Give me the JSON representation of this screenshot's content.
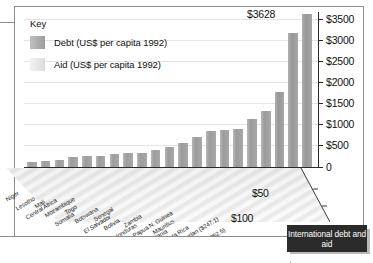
{
  "key": {
    "title": "Key",
    "items": [
      {
        "label": "Debt (US$ per capita 1992)",
        "color": "#9d9d9d",
        "name": "debt"
      },
      {
        "label": "Aid (US$ per capita 1992)",
        "color": "#e4e4e4",
        "name": "aid"
      }
    ]
  },
  "figure_title": "International debt and aid",
  "peak_annotation": "$3628",
  "chart_data": {
    "type": "bar",
    "title": "International debt and aid",
    "subtitle": "",
    "xlabel": "",
    "ylabel": "Debt (US$ per capita 1992)",
    "zlabel": "Aid (US$ per capita 1992)",
    "ylim": [
      0,
      3628
    ],
    "yticks": [
      0,
      500,
      1000,
      1500,
      2000,
      2500,
      3000,
      3500
    ],
    "ytick_labels": [
      "0",
      "$500",
      "$1000",
      "$1500",
      "$2000",
      "$2500",
      "$3000",
      "$3500"
    ],
    "zticks": [
      50,
      100,
      150
    ],
    "ztick_labels": [
      "$50",
      "$100",
      "$150"
    ],
    "grid": true,
    "legend_position": "top-left",
    "projection": "3d-perspective",
    "categories": [
      "Niger",
      "Lesotho",
      "Central Africa",
      "Mali",
      "Somalia",
      "Mozambique",
      "Togo",
      "Botswana",
      "El Salvador",
      "Senegal",
      "Bolivia",
      "Honduras",
      "Zambia",
      "Papua N. Guinea",
      "Mauritania",
      "Mauritius",
      "Costa Rica",
      "Jamaica",
      "Jordan",
      "Israel",
      "Gabon"
    ],
    "series": [
      {
        "name": "Debt (US$ per capita 1992)",
        "values": [
          110,
          150,
          175,
          230,
          250,
          260,
          300,
          330,
          340,
          400,
          470,
          560,
          700,
          840,
          870,
          900,
          1140,
          1320,
          1780,
          3180,
          3628
        ]
      },
      {
        "name": "Aid (US$ per capita 1992)",
        "values": [
          40,
          48,
          42,
          35,
          30,
          55,
          45,
          110,
          40,
          75,
          25,
          28,
          60,
          70,
          80,
          20,
          15,
          12,
          247.1,
          352.5,
          35
        ]
      }
    ],
    "annotations": [
      {
        "text": "$3628",
        "target": "Gabon",
        "series": "Debt (US$ per capita 1992)"
      },
      {
        "text": "Jordan ($247.1)",
        "target": "Jordan",
        "series": "Aid (US$ per capita 1992)"
      },
      {
        "text": "Israel ($352.5)",
        "target": "Israel",
        "series": "Aid (US$ per capita 1992)"
      }
    ],
    "axis_country_labels": [
      "Niger",
      "Lesotho",
      "Central Africa",
      "Mali",
      "Mozambique",
      "Somalia",
      "Togo",
      "Botswana",
      "El Salvador",
      "Senegal",
      "Bolivia",
      "Honduras",
      "Zambia",
      "Papua N. Guinea",
      "Mauritania",
      "Mauritius",
      "Costa Rica",
      "Jamaica",
      "Jordan ($247.1)",
      "Israel ($352.5)",
      "Gabon"
    ]
  }
}
